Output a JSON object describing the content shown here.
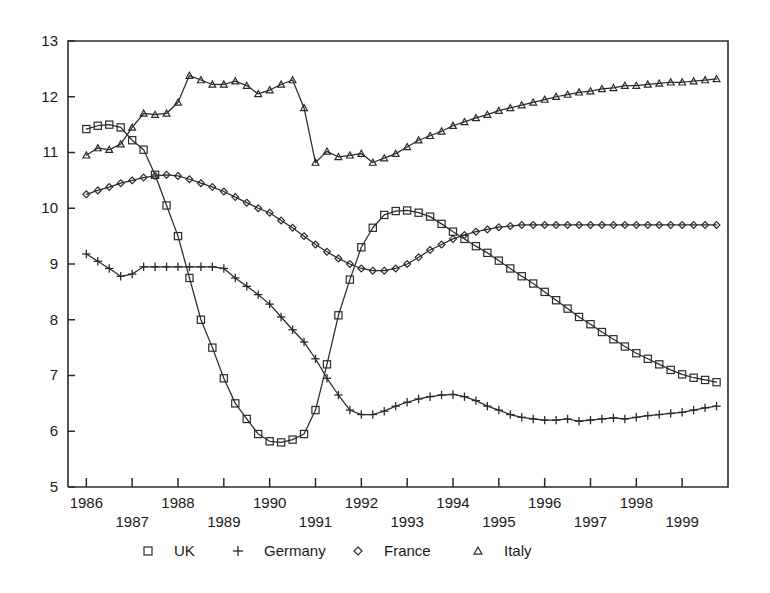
{
  "chart_data": {
    "type": "line",
    "title": "",
    "subtitle": "",
    "xlabel": "",
    "ylabel": "",
    "xlim": [
      1985.6,
      2000.0
    ],
    "ylim": [
      5,
      13
    ],
    "grid": false,
    "legend_position": "bottom",
    "y_ticks": [
      5,
      6,
      7,
      8,
      9,
      10,
      11,
      12,
      13
    ],
    "y_tick_labels": [
      "5",
      "6",
      "7",
      "8",
      "9",
      "10",
      "11",
      "12",
      "13"
    ],
    "x_ticks": [
      1986,
      1987,
      1988,
      1989,
      1990,
      1991,
      1992,
      1993,
      1994,
      1995,
      1996,
      1997,
      1998,
      1999
    ],
    "x_tick_labels": [
      "1986",
      "1987",
      "1988",
      "1989",
      "1990",
      "1991",
      "1992",
      "1993",
      "1994",
      "1995",
      "1996",
      "1997",
      "1998",
      "1999"
    ],
    "x_tick_label_rows": [
      0,
      1,
      0,
      1,
      0,
      1,
      0,
      1,
      0,
      1,
      0,
      1,
      0,
      1
    ],
    "x": [
      1986.0,
      1986.25,
      1986.5,
      1986.75,
      1987.0,
      1987.25,
      1987.5,
      1987.75,
      1988.0,
      1988.25,
      1988.5,
      1988.75,
      1989.0,
      1989.25,
      1989.5,
      1989.75,
      1990.0,
      1990.25,
      1990.5,
      1990.75,
      1991.0,
      1991.25,
      1991.5,
      1991.75,
      1992.0,
      1992.25,
      1992.5,
      1992.75,
      1993.0,
      1993.25,
      1993.5,
      1993.75,
      1994.0,
      1994.25,
      1994.5,
      1994.75,
      1995.0,
      1995.25,
      1995.5,
      1995.75,
      1996.0,
      1996.25,
      1996.5,
      1996.75,
      1997.0,
      1997.25,
      1997.5,
      1997.75,
      1998.0,
      1998.25,
      1998.5,
      1998.75,
      1999.0,
      1999.25,
      1999.5,
      1999.75
    ],
    "series": [
      {
        "name": "UK",
        "marker": "square",
        "values": [
          11.42,
          11.48,
          11.5,
          11.45,
          11.22,
          11.05,
          10.6,
          10.05,
          9.5,
          8.75,
          8.0,
          7.5,
          6.95,
          6.5,
          6.22,
          5.95,
          5.82,
          5.8,
          5.85,
          5.95,
          6.38,
          7.2,
          8.08,
          8.72,
          9.3,
          9.65,
          9.88,
          9.95,
          9.96,
          9.92,
          9.85,
          9.72,
          9.58,
          9.45,
          9.32,
          9.2,
          9.06,
          8.92,
          8.78,
          8.65,
          8.5,
          8.35,
          8.2,
          8.05,
          7.92,
          7.78,
          7.65,
          7.52,
          7.4,
          7.3,
          7.2,
          7.1,
          7.02,
          6.96,
          6.92,
          6.88
        ]
      },
      {
        "name": "Germany",
        "marker": "plus",
        "values": [
          9.18,
          9.05,
          8.92,
          8.78,
          8.82,
          8.95,
          8.95,
          8.95,
          8.95,
          8.95,
          8.95,
          8.95,
          8.92,
          8.75,
          8.6,
          8.45,
          8.28,
          8.05,
          7.82,
          7.6,
          7.3,
          6.95,
          6.65,
          6.38,
          6.3,
          6.3,
          6.36,
          6.45,
          6.52,
          6.58,
          6.62,
          6.65,
          6.66,
          6.62,
          6.55,
          6.45,
          6.38,
          6.3,
          6.25,
          6.22,
          6.2,
          6.2,
          6.22,
          6.18,
          6.2,
          6.22,
          6.24,
          6.22,
          6.25,
          6.28,
          6.3,
          6.32,
          6.34,
          6.38,
          6.42,
          6.45
        ]
      },
      {
        "name": "France",
        "marker": "diamond",
        "values": [
          10.25,
          10.32,
          10.38,
          10.45,
          10.5,
          10.55,
          10.58,
          10.6,
          10.58,
          10.52,
          10.45,
          10.38,
          10.3,
          10.2,
          10.1,
          10.0,
          9.92,
          9.78,
          9.65,
          9.5,
          9.35,
          9.22,
          9.1,
          9.0,
          8.92,
          8.88,
          8.88,
          8.92,
          9.0,
          9.12,
          9.25,
          9.35,
          9.45,
          9.52,
          9.58,
          9.62,
          9.66,
          9.68,
          9.7,
          9.7,
          9.7,
          9.7,
          9.7,
          9.7,
          9.7,
          9.7,
          9.7,
          9.7,
          9.7,
          9.7,
          9.7,
          9.7,
          9.7,
          9.7,
          9.7,
          9.7
        ]
      },
      {
        "name": "Italy",
        "marker": "triangle",
        "values": [
          10.95,
          11.08,
          11.05,
          11.15,
          11.45,
          11.7,
          11.68,
          11.7,
          11.9,
          12.38,
          12.3,
          12.22,
          12.22,
          12.28,
          12.2,
          12.05,
          12.12,
          12.22,
          12.3,
          11.8,
          10.82,
          11.02,
          10.92,
          10.95,
          10.98,
          10.82,
          10.9,
          10.98,
          11.1,
          11.22,
          11.3,
          11.38,
          11.48,
          11.55,
          11.62,
          11.68,
          11.75,
          11.8,
          11.85,
          11.9,
          11.95,
          12.0,
          12.04,
          12.08,
          12.1,
          12.14,
          12.16,
          12.2,
          12.2,
          12.22,
          12.24,
          12.26,
          12.26,
          12.28,
          12.3,
          12.32
        ]
      }
    ],
    "legend": [
      {
        "label": "UK",
        "marker": "square"
      },
      {
        "label": "Germany",
        "marker": "plus"
      },
      {
        "label": "France",
        "marker": "diamond"
      },
      {
        "label": "Italy",
        "marker": "triangle"
      }
    ]
  }
}
